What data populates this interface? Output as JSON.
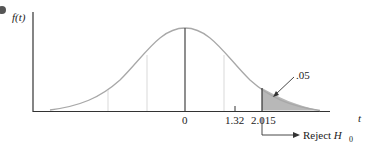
{
  "chart_data": {
    "type": "area",
    "title": "",
    "ylabel": "f(t)",
    "xlabel": "t",
    "tick_labels": [
      "0",
      "1.32",
      "2.015"
    ],
    "critical_value": 2.015,
    "test_statistic": 1.32,
    "shaded_area": ".05",
    "annotation_arrow_label": ".05",
    "rejection_label": "Reject H",
    "rejection_subscript": "0",
    "grid": false,
    "legend": null
  },
  "colors": {
    "curve": "#a8a8a8",
    "shade": "#b8b8b8",
    "axis": "#333333",
    "bullet": "#555555"
  }
}
